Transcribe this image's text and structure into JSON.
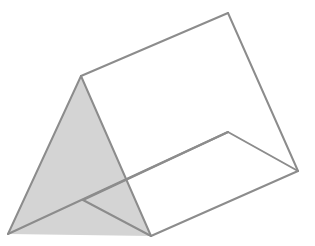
{
  "figure": {
    "type": "triangular-prism",
    "width": 315,
    "height": 246,
    "colors": {
      "background": "#ffffff",
      "stroke": "#8c8c8c",
      "face_fill": "#d4d4d4"
    },
    "stroke_width": 2,
    "vertices": {
      "front_apex": [
        81,
        76
      ],
      "front_left": [
        8,
        234
      ],
      "front_right": [
        151,
        236
      ],
      "fold_point": [
        83,
        200
      ],
      "back_apex": [
        228,
        13
      ],
      "back_left": [
        228,
        132
      ],
      "back_right": [
        298,
        171
      ]
    },
    "shaded_face": [
      "front_apex",
      "front_left",
      "front_right"
    ],
    "edges": [
      [
        "front_apex",
        "front_left"
      ],
      [
        "front_apex",
        "front_right"
      ],
      [
        "front_apex",
        "back_apex"
      ],
      [
        "back_apex",
        "back_right"
      ],
      [
        "front_right",
        "back_right"
      ],
      [
        "back_left",
        "back_right"
      ],
      [
        "front_left",
        "back_left"
      ],
      [
        "fold_point",
        "back_left"
      ],
      [
        "fold_point",
        "front_right"
      ]
    ]
  }
}
